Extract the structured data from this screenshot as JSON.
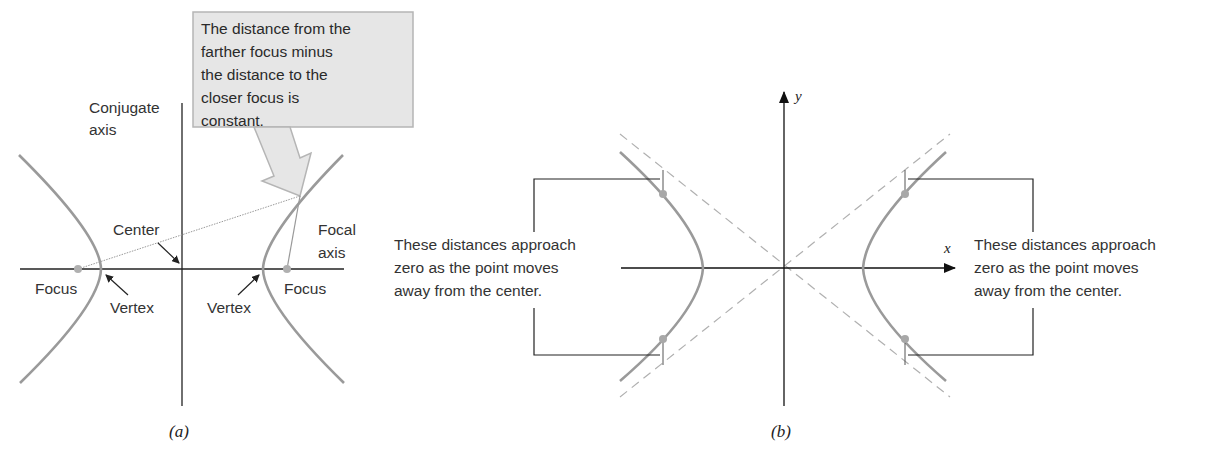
{
  "figure_a": {
    "callout": "The distance from the farther focus minus the distance to the closer focus is constant.",
    "conjugate_axis": [
      "Conjugate",
      "axis"
    ],
    "focal_axis": [
      "Focal",
      "axis"
    ],
    "center": "Center",
    "focus_left": "Focus",
    "focus_right": "Focus",
    "vertex_left": "Vertex",
    "vertex_right": "Vertex",
    "caption": "(a)"
  },
  "figure_b": {
    "left_note": [
      "These distances approach",
      "zero as the point moves",
      "away from the center."
    ],
    "right_note": [
      "These distances approach",
      "zero as the point moves",
      "away from the center."
    ],
    "x_label": "x",
    "y_label": "y",
    "caption": "(b)"
  },
  "colors": {
    "curve": "#9a9a9a",
    "axis": "#222222",
    "asymptote": "#b0b0b0",
    "callout_fill": "#e6e6e6",
    "point": "#a8a8a8"
  }
}
